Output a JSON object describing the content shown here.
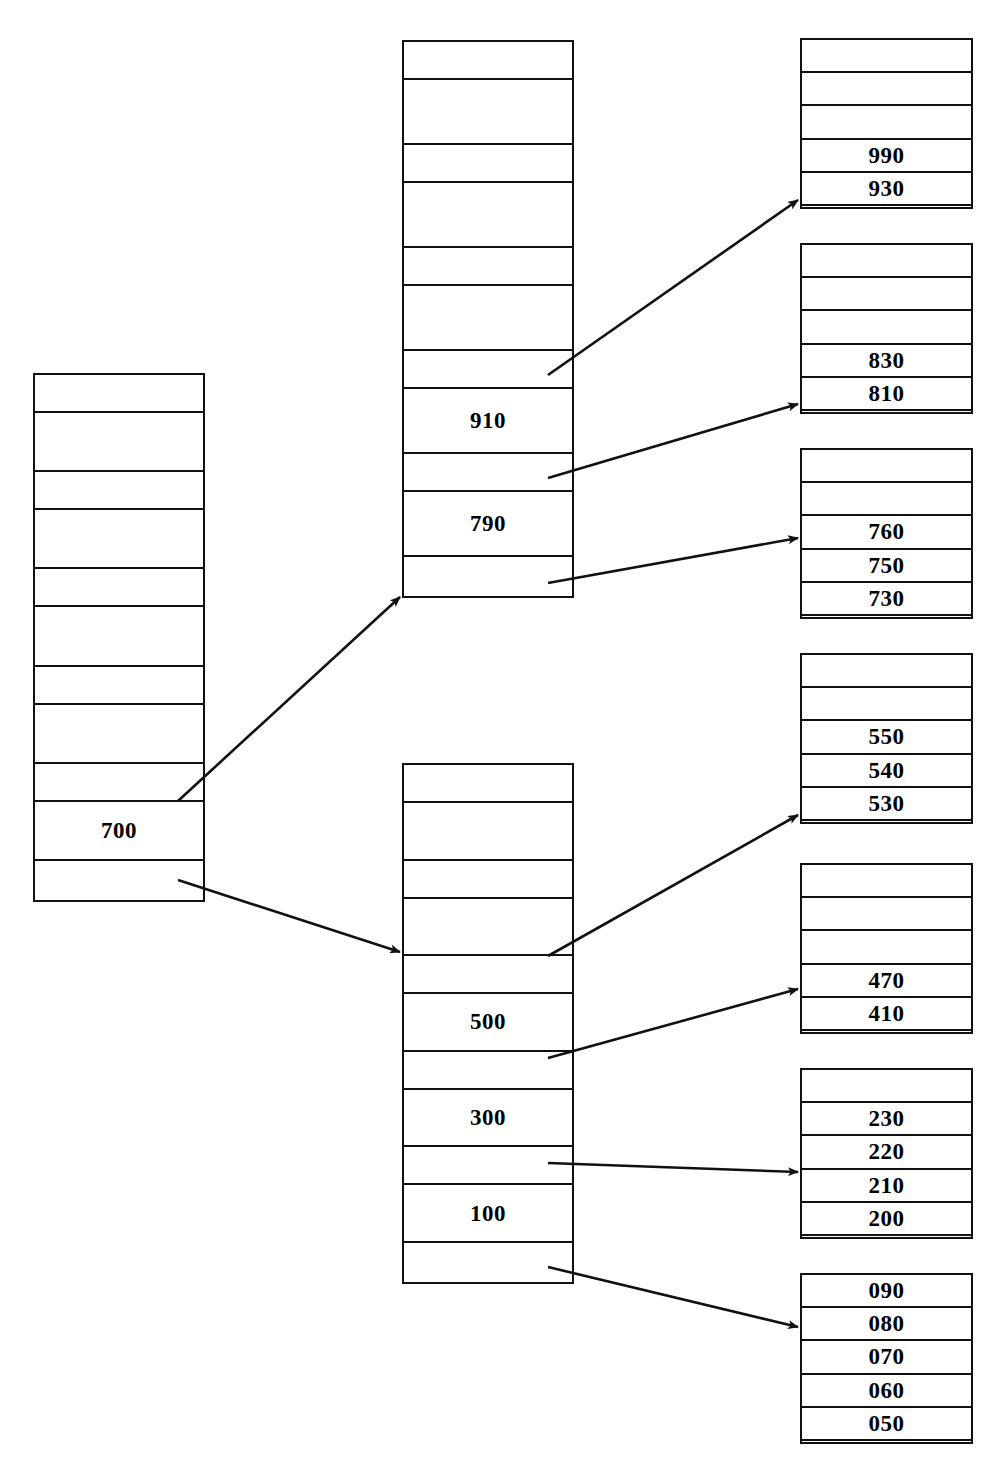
{
  "diagram": {
    "line_color": "#111111",
    "background_color": "#ffffff"
  },
  "nodes": {
    "root": {
      "name": "root-node",
      "x": 33,
      "y": 373,
      "width": 172,
      "height": 529,
      "cells": [
        {
          "type": "pointer",
          "value": ""
        },
        {
          "type": "key",
          "value": ""
        },
        {
          "type": "pointer",
          "value": ""
        },
        {
          "type": "key",
          "value": ""
        },
        {
          "type": "pointer",
          "value": ""
        },
        {
          "type": "key",
          "value": ""
        },
        {
          "type": "pointer",
          "value": ""
        },
        {
          "type": "key",
          "value": ""
        },
        {
          "type": "pointer",
          "value": ""
        },
        {
          "type": "key",
          "value": "700"
        },
        {
          "type": "pointer",
          "value": ""
        }
      ]
    },
    "branch_upper": {
      "name": "branch-node-upper",
      "x": 402,
      "y": 40,
      "width": 172,
      "height": 558,
      "cells": [
        {
          "type": "pointer",
          "value": ""
        },
        {
          "type": "key",
          "value": ""
        },
        {
          "type": "pointer",
          "value": ""
        },
        {
          "type": "key",
          "value": ""
        },
        {
          "type": "pointer",
          "value": ""
        },
        {
          "type": "key",
          "value": ""
        },
        {
          "type": "pointer",
          "value": ""
        },
        {
          "type": "key",
          "value": "910"
        },
        {
          "type": "pointer",
          "value": ""
        },
        {
          "type": "key",
          "value": "790"
        },
        {
          "type": "pointer",
          "value": ""
        }
      ]
    },
    "branch_lower": {
      "name": "branch-node-lower",
      "x": 402,
      "y": 763,
      "width": 172,
      "height": 521,
      "cells": [
        {
          "type": "pointer",
          "value": ""
        },
        {
          "type": "key",
          "value": ""
        },
        {
          "type": "pointer",
          "value": ""
        },
        {
          "type": "key",
          "value": ""
        },
        {
          "type": "pointer",
          "value": ""
        },
        {
          "type": "key",
          "value": "500"
        },
        {
          "type": "pointer",
          "value": ""
        },
        {
          "type": "key",
          "value": "300"
        },
        {
          "type": "pointer",
          "value": ""
        },
        {
          "type": "key",
          "value": "100"
        },
        {
          "type": "pointer",
          "value": ""
        }
      ]
    }
  },
  "leaves": [
    {
      "name": "leaf-node-1",
      "x": 800,
      "y": 38,
      "width": 173,
      "height": 171,
      "rows": [
        "",
        "",
        "",
        "990",
        "930"
      ]
    },
    {
      "name": "leaf-node-2",
      "x": 800,
      "y": 243,
      "width": 173,
      "height": 171,
      "rows": [
        "",
        "",
        "",
        "830",
        "810"
      ]
    },
    {
      "name": "leaf-node-3",
      "x": 800,
      "y": 448,
      "width": 173,
      "height": 171,
      "rows": [
        "",
        "",
        "760",
        "750",
        "730"
      ]
    },
    {
      "name": "leaf-node-4",
      "x": 800,
      "y": 653,
      "width": 173,
      "height": 171,
      "rows": [
        "",
        "",
        "550",
        "540",
        "530"
      ]
    },
    {
      "name": "leaf-node-5",
      "x": 800,
      "y": 863,
      "width": 173,
      "height": 171,
      "rows": [
        "",
        "",
        "",
        "470",
        "410"
      ]
    },
    {
      "name": "leaf-node-6",
      "x": 800,
      "y": 1068,
      "width": 173,
      "height": 171,
      "rows": [
        "",
        "230",
        "220",
        "210",
        "200"
      ]
    },
    {
      "name": "leaf-node-7",
      "x": 800,
      "y": 1273,
      "width": 173,
      "height": 171,
      "rows": [
        "090",
        "080",
        "070",
        "060",
        "050"
      ]
    }
  ],
  "arrows": [
    {
      "name": "arrow-root-to-branch-upper",
      "x1": 178,
      "y1": 801,
      "x2": 400,
      "y2": 597
    },
    {
      "name": "arrow-root-to-branch-lower",
      "x1": 178,
      "y1": 880,
      "x2": 400,
      "y2": 952
    },
    {
      "name": "arrow-branch-upper-to-leaf-1",
      "x1": 548,
      "y1": 375,
      "x2": 798,
      "y2": 200
    },
    {
      "name": "arrow-branch-upper-to-leaf-2",
      "x1": 548,
      "y1": 478,
      "x2": 798,
      "y2": 404
    },
    {
      "name": "arrow-branch-upper-to-leaf-3",
      "x1": 548,
      "y1": 583,
      "x2": 798,
      "y2": 538
    },
    {
      "name": "arrow-branch-lower-to-leaf-4",
      "x1": 548,
      "y1": 956,
      "x2": 798,
      "y2": 815
    },
    {
      "name": "arrow-branch-lower-to-leaf-5",
      "x1": 548,
      "y1": 1058,
      "x2": 798,
      "y2": 989
    },
    {
      "name": "arrow-branch-lower-to-leaf-6",
      "x1": 548,
      "y1": 1163,
      "x2": 798,
      "y2": 1172
    },
    {
      "name": "arrow-branch-lower-to-leaf-7",
      "x1": 548,
      "y1": 1267,
      "x2": 798,
      "y2": 1327
    }
  ]
}
